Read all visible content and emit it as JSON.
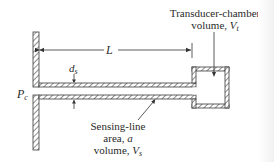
{
  "diagram": {
    "type": "sensing-line and transducer-chamber schematic",
    "labels": {
      "length": "L",
      "diameter_base": "d",
      "diameter_sub": "s",
      "pressure_base": "P",
      "pressure_sub": "c",
      "transducer_line1": "Transducer-chamber",
      "transducer_line2_prefix": "volume, ",
      "transducer_var_base": "V",
      "transducer_var_sub": "t",
      "sensing_line1": "Sensing-line",
      "sensing_line2_prefix": "area, ",
      "sensing_area_var": "a",
      "sensing_line3_prefix": "volume, ",
      "sensing_var_base": "V",
      "sensing_var_sub": "s"
    },
    "components": [
      {
        "name": "wall",
        "description": "hatched vertical wall at left with port opening"
      },
      {
        "name": "sensing-line",
        "description": "hatched horizontal tube of length L and diameter d_s"
      },
      {
        "name": "transducer-chamber",
        "description": "hatched square chamber at right end of tube"
      }
    ],
    "colors": {
      "line": "#3a3a3a",
      "text": "#2a2a2a",
      "background": "#ffffff"
    }
  }
}
